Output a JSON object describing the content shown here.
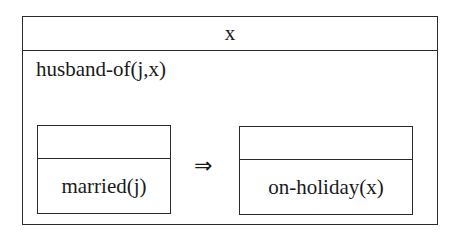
{
  "drs": {
    "universe": "x",
    "conditions": [
      "husband-of(j,x)"
    ],
    "implication": {
      "antecedent": {
        "universe": "",
        "conditions": [
          "married(j)"
        ]
      },
      "connective": "⇒",
      "consequent": {
        "universe": "",
        "conditions": [
          "on-holiday(x)"
        ]
      }
    }
  },
  "colors": {
    "line": "#2a2a2a",
    "text": "#1a1a1a",
    "background": "#ffffff"
  }
}
